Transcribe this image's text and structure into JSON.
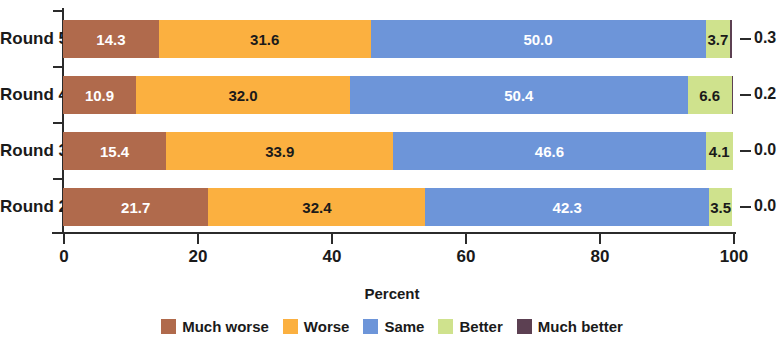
{
  "chart_data": {
    "type": "bar",
    "orientation": "horizontal",
    "stacked": true,
    "stack_mode": "percent",
    "title": "",
    "subtitle": "",
    "xlabel": "Percent",
    "ylabel": "",
    "xlim": [
      0,
      100
    ],
    "xticks": [
      0,
      20,
      40,
      60,
      80,
      100
    ],
    "xtick_labels": [
      "0",
      "20",
      "40",
      "60",
      "80",
      "100"
    ],
    "grid": false,
    "legend_position": "bottom",
    "categories": [
      "Round 5",
      "Round 4",
      "Round 3",
      "Round 2"
    ],
    "series": [
      {
        "name": "Much worse",
        "color": "#b06a4c",
        "values": [
          14.3,
          10.9,
          15.4,
          21.7
        ],
        "label_color": "#ffffff"
      },
      {
        "name": "Worse",
        "color": "#fbb040",
        "values": [
          31.6,
          32.0,
          33.9,
          32.4
        ],
        "label_color": "#1a1a1a"
      },
      {
        "name": "Same",
        "color": "#6d95d9",
        "values": [
          50.0,
          50.4,
          46.6,
          42.3
        ],
        "label_color": "#ffffff"
      },
      {
        "name": "Better",
        "color": "#cfe28d",
        "values": [
          3.7,
          6.6,
          4.1,
          3.5
        ],
        "label_color": "#1a1a1a"
      },
      {
        "name": "Much better",
        "color": "#5c4052",
        "values": [
          0.3,
          0.2,
          0.0,
          0.0
        ],
        "label_color": "#1a1a1a"
      }
    ],
    "outside_annotations": {
      "series_name": "Much better",
      "values": [
        "0.3",
        "0.2",
        "0.0",
        "0.0"
      ]
    }
  },
  "axis": {
    "x_title": "Percent",
    "x_tick_labels": [
      "0",
      "20",
      "40",
      "60",
      "80",
      "100"
    ],
    "y_tick_labels": [
      "Round 5",
      "Round 4",
      "Round 3",
      "Round 2"
    ]
  },
  "legend": {
    "items": [
      {
        "label": "Much worse",
        "color": "#b06a4c"
      },
      {
        "label": "Worse",
        "color": "#fbb040"
      },
      {
        "label": "Same",
        "color": "#6d95d9"
      },
      {
        "label": "Better",
        "color": "#cfe28d"
      },
      {
        "label": "Much better",
        "color": "#5c4052"
      }
    ]
  }
}
